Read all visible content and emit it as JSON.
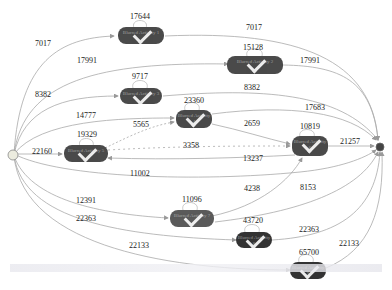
{
  "diagram": {
    "type": "process-map",
    "start_node": {
      "id": "start",
      "shape": "circle",
      "color": "#e8e8e0"
    },
    "end_node": {
      "id": "end",
      "shape": "circle",
      "color": "#444444"
    },
    "nodes": [
      {
        "id": "n1",
        "label": "Blurred Activity 1",
        "count": "",
        "self_loop": "17644"
      },
      {
        "id": "n2",
        "label": "Blurred Activity 2",
        "count": "",
        "self_loop": "15128"
      },
      {
        "id": "n3",
        "label": "Blurred Activity 3",
        "count": "",
        "self_loop": "9717"
      },
      {
        "id": "n4",
        "label": "Blurred Activity 4",
        "count": "",
        "self_loop": "23360"
      },
      {
        "id": "n5",
        "label": "Blurred Activity 5",
        "count": "",
        "self_loop": "19329"
      },
      {
        "id": "n6",
        "label": "Blurred Activity 6",
        "count": "",
        "self_loop": "10819"
      },
      {
        "id": "n7",
        "label": "Blurred Activity 7",
        "count": "",
        "self_loop": "11096"
      },
      {
        "id": "n8",
        "label": "Blurred Activity 8",
        "count": "",
        "self_loop": "43720"
      },
      {
        "id": "n9",
        "label": "Blurred Activity 9",
        "count": "",
        "self_loop": "65700"
      }
    ],
    "edges": [
      {
        "from": "start",
        "to": "n1",
        "label": "7017"
      },
      {
        "from": "n1",
        "to": "end",
        "label": "7017"
      },
      {
        "from": "start",
        "to": "n2",
        "label": "17991"
      },
      {
        "from": "n2",
        "to": "end",
        "label": "17991"
      },
      {
        "from": "start",
        "to": "n3",
        "label": "8382"
      },
      {
        "from": "n3",
        "to": "end",
        "label": "8382"
      },
      {
        "from": "start",
        "to": "n4",
        "label": "14777"
      },
      {
        "from": "n4",
        "to": "end",
        "label": "17683"
      },
      {
        "from": "n5",
        "to": "n4",
        "label": "5565"
      },
      {
        "from": "n4",
        "to": "n6",
        "label": "2659"
      },
      {
        "from": "start",
        "to": "n5",
        "label": "22160"
      },
      {
        "from": "n5",
        "to": "n6",
        "label": "3358"
      },
      {
        "from": "n6",
        "to": "n5",
        "label": "13237"
      },
      {
        "from": "n6",
        "to": "end",
        "label": "21257"
      },
      {
        "from": "start",
        "to": "end",
        "label": "11002"
      },
      {
        "from": "start",
        "to": "n7",
        "label": "12391"
      },
      {
        "from": "n7",
        "to": "n6",
        "label": "4238"
      },
      {
        "from": "n7",
        "to": "end",
        "label": "8153"
      },
      {
        "from": "start",
        "to": "n8",
        "label": "22363"
      },
      {
        "from": "n8",
        "to": "end",
        "label": "22363"
      },
      {
        "from": "start",
        "to": "n9",
        "label": "22133"
      },
      {
        "from": "n9",
        "to": "end",
        "label": "22133"
      }
    ]
  }
}
